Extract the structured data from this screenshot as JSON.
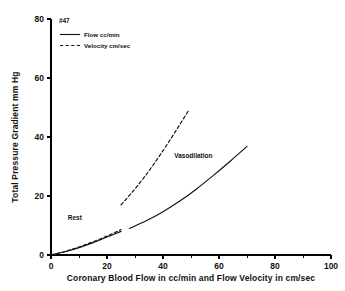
{
  "chart_data": {
    "type": "line",
    "title": "",
    "subtitle": "",
    "annotation_id": "#47",
    "xlabel": "Coronary Blood Flow in cc/min and Flow Velocity in cm/sec",
    "ylabel": "Total Pressure Gradient mm Hg",
    "xlim": [
      0,
      100
    ],
    "ylim": [
      0,
      80
    ],
    "xticks": [
      0,
      20,
      40,
      60,
      80,
      100
    ],
    "xticklabels": [
      "0",
      "20",
      "40",
      "60",
      "80",
      "100"
    ],
    "xminorticks": [
      10,
      30,
      50,
      70,
      90
    ],
    "yticks": [
      0,
      20,
      40,
      60,
      80
    ],
    "yticklabels": [
      "0",
      "20",
      "40",
      "60",
      "80"
    ],
    "grid": false,
    "legend_position": "upper-left",
    "legend": [
      {
        "label": "Flow cc/min",
        "style": "solid"
      },
      {
        "label": "Velocity cm/sec",
        "style": "dashed"
      }
    ],
    "annotations": [
      {
        "text": "Rest",
        "x": 6,
        "y": 12
      },
      {
        "text": "Vasodilation",
        "x": 44,
        "y": 33
      }
    ],
    "series": [
      {
        "name": "Flow cc/min",
        "style": "solid",
        "segments": [
          {
            "phase": "Rest",
            "x": [
              0,
              5,
              10,
              15,
              20,
              25
            ],
            "y": [
              0,
              1.1,
              2.5,
              4.2,
              6.1,
              8.0
            ]
          },
          {
            "phase": "Vasodilation",
            "x": [
              28,
              34,
              40,
              46,
              52,
              58,
              64,
              70
            ],
            "y": [
              9.0,
              11.6,
              14.7,
              18.3,
              22.4,
              27.0,
              31.8,
              36.8
            ]
          }
        ]
      },
      {
        "name": "Velocity cm/sec",
        "style": "dashed",
        "segments": [
          {
            "phase": "Rest",
            "x": [
              0,
              5,
              10,
              15,
              20,
              25
            ],
            "y": [
              0,
              1.2,
              2.7,
              4.5,
              6.4,
              8.6
            ]
          },
          {
            "phase": "Vasodilation",
            "x": [
              25,
              29,
              33,
              37,
              41,
              45,
              49
            ],
            "y": [
              17.0,
              21.3,
              26.0,
              31.2,
              36.8,
              42.7,
              48.8
            ]
          }
        ]
      }
    ]
  }
}
